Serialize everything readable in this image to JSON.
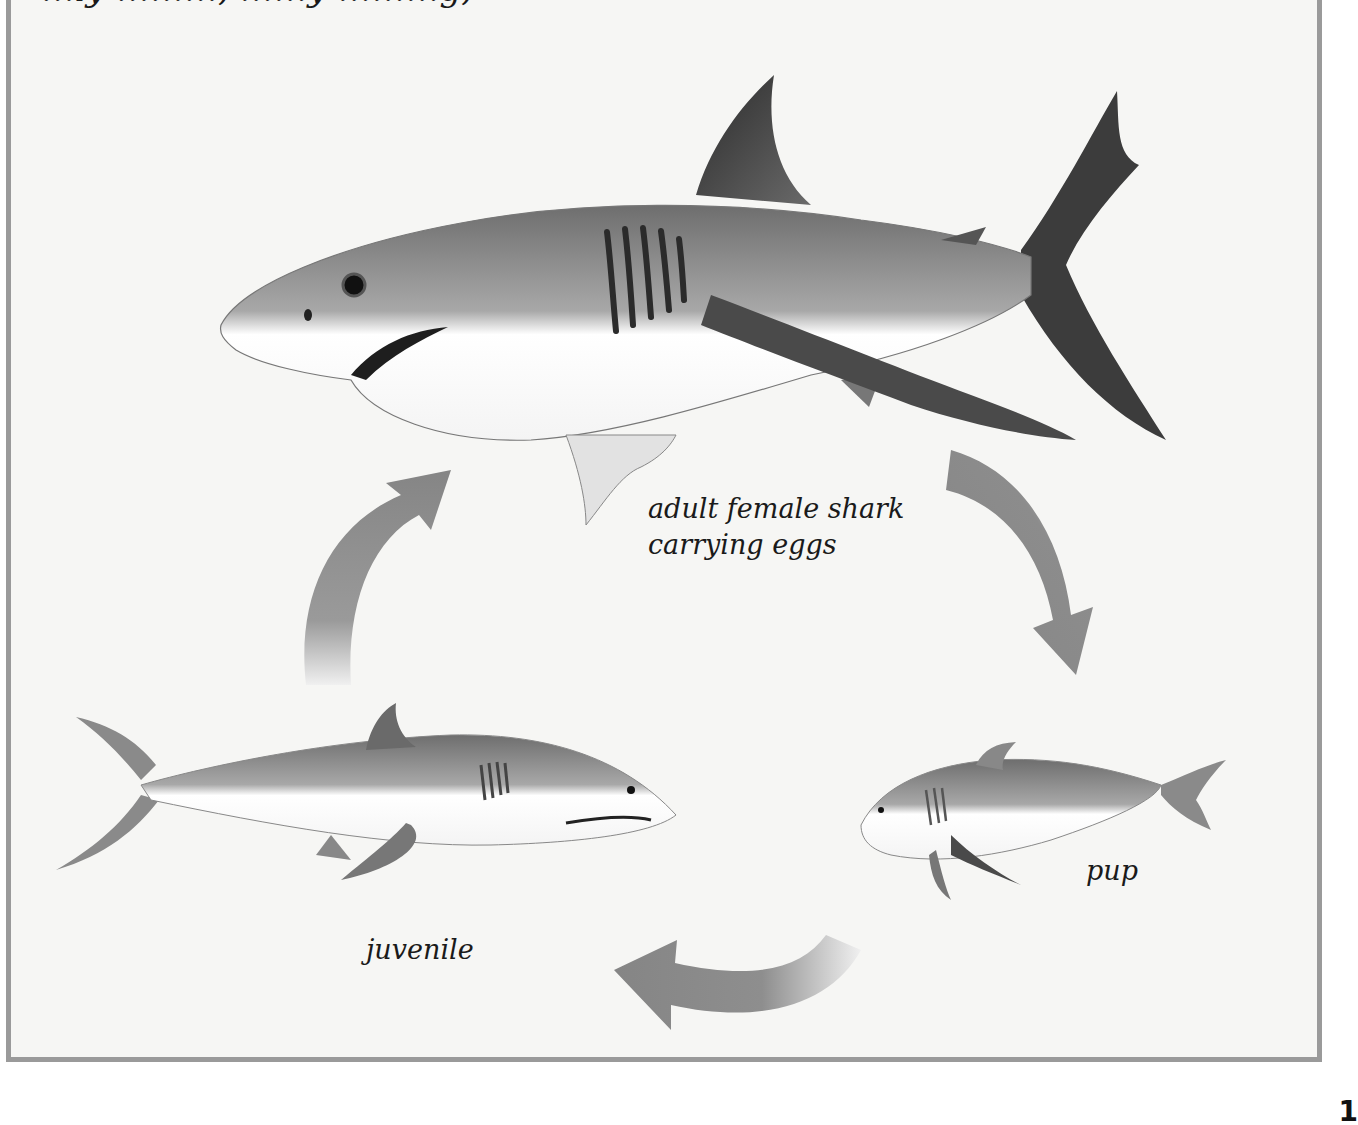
{
  "figure": {
    "top_text_partial": "…ly  ………, ……y  ………g,",
    "stages": [
      {
        "id": "adult",
        "label_line1": "adult female shark",
        "label_line2": "carrying eggs",
        "icon": "adult-shark-illustration"
      },
      {
        "id": "pup",
        "label": "pup",
        "icon": "pup-shark-illustration"
      },
      {
        "id": "juvenile",
        "label": "juvenile",
        "icon": "juvenile-shark-illustration"
      }
    ],
    "arrows": [
      {
        "from": "adult",
        "to": "pup",
        "direction": "clockwise-down"
      },
      {
        "from": "pup",
        "to": "juvenile",
        "direction": "leftward"
      },
      {
        "from": "juvenile",
        "to": "adult",
        "direction": "upward"
      }
    ],
    "colors": {
      "frame": "#9a9a9a",
      "background": "#f6f6f4",
      "arrow": "#8a8a8a",
      "shark_dark": "#3a3a3a",
      "shark_mid": "#8c8c8c",
      "shark_belly": "#ffffff"
    }
  },
  "page_number": "1"
}
